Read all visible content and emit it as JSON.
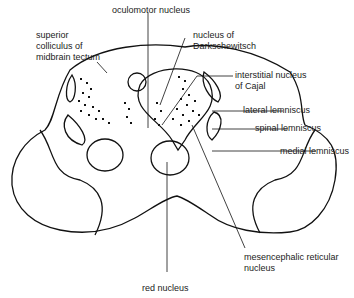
{
  "diagram": {
    "labels": {
      "oculomotor": "oculomotor nucleus",
      "superior_colliculus": "superior\ncolliculus of\nmidbrain tectum",
      "darkschewitsch": "nucleus of\nDarkschewitsch",
      "cajal": "interstitial nucleus\nof Cajal",
      "lateral_lemniscus": "lateral lemniscus",
      "spinal_lemniscus": "spinal lemniscus",
      "medial_lemniscus": "medial lemniscus",
      "mesencephalic": "mesencephalic reticular\nnucleus",
      "red_nucleus": "red nucleus"
    }
  }
}
